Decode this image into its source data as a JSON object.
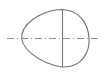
{
  "diagram": {
    "colors": {
      "background": "#ffffff",
      "outline": "#6e6e6e",
      "centerline": "#8c8c8c"
    },
    "elements": [
      {
        "type": "egg-shape",
        "name": "cam-outline"
      },
      {
        "type": "line",
        "name": "vertical-axis"
      },
      {
        "type": "dash-dot-line",
        "name": "horizontal-centerline"
      }
    ]
  }
}
